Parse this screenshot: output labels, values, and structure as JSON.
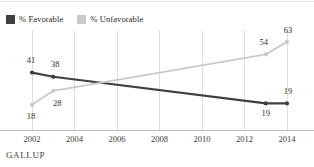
{
  "footer": {
    "brand": "GALLUP"
  },
  "legend": {
    "items": [
      {
        "label": "% Favorable",
        "color": "#3f3f3f",
        "icon": "legend-swatch-square"
      },
      {
        "label": "% Unfavorable",
        "color": "#c9c9c9",
        "icon": "legend-swatch-square"
      }
    ]
  },
  "chart_data": {
    "type": "line",
    "title": "",
    "subtitle": "",
    "xlabel": "",
    "ylabel": "",
    "grid": "vertical",
    "legend_position": "top-left",
    "x": [
      2002,
      2003,
      2013,
      2014
    ],
    "xlim": [
      2002,
      2014
    ],
    "ylim": [
      0,
      70
    ],
    "xticks": [
      2002,
      2004,
      2006,
      2008,
      2010,
      2012,
      2014
    ],
    "xticklabels": [
      "2002",
      "2004",
      "2006",
      "2008",
      "2010",
      "2012",
      "2014"
    ],
    "series": [
      {
        "name": "% Favorable",
        "color": "#3f3f3f",
        "values": [
          41,
          38,
          19,
          19
        ],
        "point_labels": [
          "41",
          "38",
          "19",
          "19"
        ]
      },
      {
        "name": "% Unfavorable",
        "color": "#c9c9c9",
        "values": [
          18,
          28,
          54,
          63
        ],
        "point_labels": [
          "18",
          "28",
          "54",
          "63"
        ]
      }
    ],
    "annotations": [
      {
        "text": "41",
        "x": 2002,
        "y": 41,
        "series": "% Favorable"
      },
      {
        "text": "38",
        "x": 2003,
        "y": 38,
        "series": "% Favorable"
      },
      {
        "text": "19",
        "x": 2013,
        "y": 19,
        "series": "% Favorable"
      },
      {
        "text": "19",
        "x": 2014,
        "y": 19,
        "series": "% Favorable"
      },
      {
        "text": "18",
        "x": 2002,
        "y": 18,
        "series": "% Unfavorable"
      },
      {
        "text": "28",
        "x": 2003,
        "y": 28,
        "series": "% Unfavorable"
      },
      {
        "text": "54",
        "x": 2013,
        "y": 54,
        "series": "% Unfavorable"
      },
      {
        "text": "63",
        "x": 2014,
        "y": 63,
        "series": "% Unfavorable"
      }
    ]
  }
}
